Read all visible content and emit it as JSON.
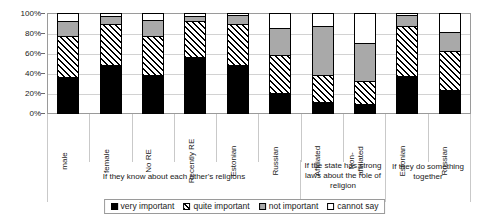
{
  "chart_data": {
    "type": "bar",
    "subtype": "stacked-percent",
    "title": "",
    "xlabel": "",
    "ylabel": "",
    "ylim": [
      0,
      100
    ],
    "ytick_labels": [
      "100%",
      "80%",
      "60%",
      "40%",
      "20%",
      "0%"
    ],
    "ytick_values": [
      100,
      80,
      60,
      40,
      20,
      0
    ],
    "grid": true,
    "legend_position": "bottom",
    "categories": [
      "male",
      "female",
      "No RE",
      "Recently RE",
      "Estonian",
      "Russian",
      "Affiliated",
      "Non-affiliated",
      "Estonian",
      "Russian"
    ],
    "series": [
      {
        "name": "very important",
        "values": [
          35,
          47,
          37,
          56,
          47,
          19,
          10,
          8,
          36,
          22
        ]
      },
      {
        "name": "quite important",
        "values": [
          42,
          42,
          40,
          36,
          42,
          39,
          27,
          23,
          51,
          40
        ]
      },
      {
        "name": "not important",
        "values": [
          15,
          8,
          16,
          5,
          9,
          27,
          50,
          39,
          11,
          19
        ]
      },
      {
        "name": "cannot say",
        "values": [
          8,
          3,
          7,
          3,
          2,
          15,
          13,
          30,
          2,
          19
        ]
      }
    ],
    "group_captions": [
      {
        "label": "If they know about each other's religions",
        "span": 6
      },
      {
        "label": "If the state has strong laws about the role of religion",
        "span": 2
      },
      {
        "label": "If they do something together",
        "span": 2
      }
    ],
    "legend": [
      {
        "label": "very important",
        "swatch": "solid-black"
      },
      {
        "label": "quite important",
        "swatch": "diagonal-hatch"
      },
      {
        "label": "not important",
        "swatch": "solid-gray"
      },
      {
        "label": "cannot say",
        "swatch": "white-outline"
      }
    ],
    "colors": {
      "very_important": "#000000",
      "quite_important": "#ffffff",
      "not_important": "#a9a9a9",
      "cannot_say": "#ffffff",
      "axis": "#9a9a9a",
      "grid": "#d2d2d2",
      "text": "#1a1a1a"
    }
  }
}
